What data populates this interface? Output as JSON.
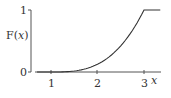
{
  "chart_data": {
    "type": "line",
    "title": "",
    "xlabel": "x",
    "ylabel": "F(x)",
    "ylabel_parts": {
      "prefix": "F(",
      "var": "x",
      "suffix": ")"
    },
    "xticks": [
      1,
      2,
      3
    ],
    "xtick_labels": [
      "1",
      "2",
      "3"
    ],
    "yticks": [
      0,
      1
    ],
    "ytick_labels": [
      "0",
      "1"
    ],
    "xlim": [
      0.7,
      3.4
    ],
    "ylim": [
      0,
      1
    ],
    "grid": false,
    "legend": null,
    "series": [
      {
        "name": "F(x)",
        "description": "CDF: 0 for x<1, rising as ((x-1)/2)^3 on [1,3], equal to 1 for x>=3",
        "x": [
          0.7,
          1.0,
          1.25,
          1.5,
          1.75,
          2.0,
          2.25,
          2.5,
          2.75,
          3.0,
          3.3
        ],
        "y": [
          0,
          0,
          0.002,
          0.016,
          0.053,
          0.125,
          0.244,
          0.422,
          0.67,
          1.0,
          1.0
        ]
      }
    ]
  },
  "colors": {
    "line": "#333333",
    "axis": "#555555",
    "background": "#ffffff"
  }
}
